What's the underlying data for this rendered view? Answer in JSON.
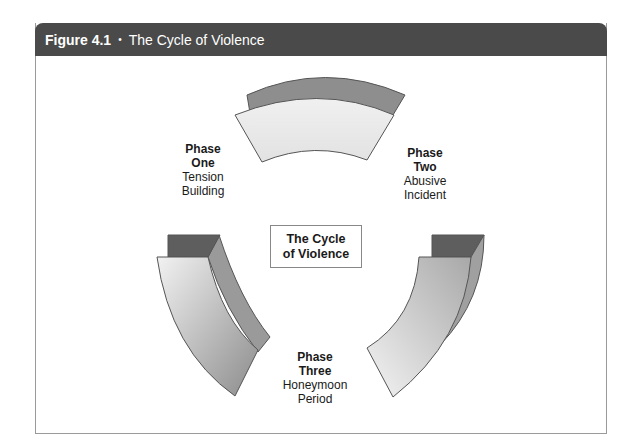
{
  "figure": {
    "number_label": "Figure 4.1",
    "separator": "•",
    "title": "The Cycle of Violence"
  },
  "center": {
    "line1": "The Cycle",
    "line2": "of Violence"
  },
  "phases": [
    {
      "heading1": "Phase",
      "heading2": "One",
      "desc1": "Tension",
      "desc2": "Building"
    },
    {
      "heading1": "Phase",
      "heading2": "Two",
      "desc1": "Abusive",
      "desc2": "Incident"
    },
    {
      "heading1": "Phase",
      "heading2": "Three",
      "desc1": "Honeymoon",
      "desc2": "Period"
    }
  ],
  "colors": {
    "header_bg": "#4a4a4a",
    "arrow_dark": "#7a7a7a",
    "arrow_light": "#e6e6e6",
    "stroke": "#555555"
  }
}
